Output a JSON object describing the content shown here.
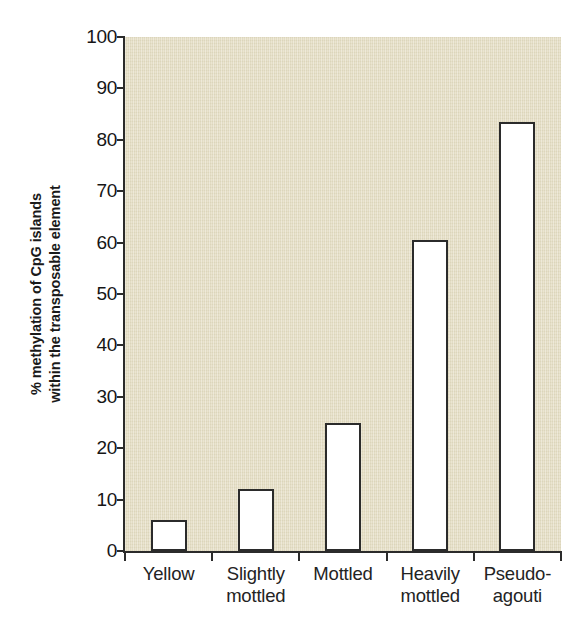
{
  "chart_data": {
    "type": "bar",
    "title": "",
    "subtitle": "",
    "xlabel": "",
    "ylabel": "% methylation of CpG islands within the transposable element",
    "ylabel_lines": [
      "% methylation of CpG islands",
      "within the transposable element"
    ],
    "categories": [
      "Yellow",
      "Slightly mottled",
      "Mottled",
      "Heavily mottled",
      "Pseudo-agouti"
    ],
    "category_lines": [
      [
        "Yellow"
      ],
      [
        "Slightly",
        "mottled"
      ],
      [
        "Mottled"
      ],
      [
        "Heavily",
        "mottled"
      ],
      [
        "Pseudo-",
        "agouti"
      ]
    ],
    "values": [
      6,
      12,
      25,
      60.5,
      83.5
    ],
    "ylim": [
      0,
      100
    ],
    "ytick_values": [
      0,
      10,
      20,
      30,
      40,
      50,
      60,
      70,
      80,
      90,
      100
    ],
    "ytick_labels": [
      "0",
      "10",
      "20",
      "30",
      "40",
      "50",
      "60",
      "70",
      "80",
      "90",
      "100"
    ],
    "grid": false,
    "legend": null,
    "bar_fill_color": "#ffffff",
    "bar_edge_color": "#2b2b2b",
    "plot_background_color": "#e4ddc2",
    "axis_color": "#2b2b2b",
    "text_color": "#1a1a1a"
  }
}
